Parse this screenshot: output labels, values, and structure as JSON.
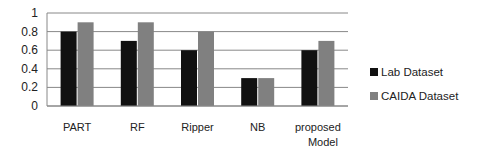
{
  "chart_data": {
    "type": "bar",
    "title": "",
    "xlabel": "",
    "ylabel": "",
    "ylim": [
      0,
      1
    ],
    "yticks": [
      "0",
      "0.2",
      "0.4",
      "0.6",
      "0.8",
      "1"
    ],
    "grid": true,
    "legend_position": "right",
    "categories": [
      "PART",
      "RF",
      "Ripper",
      "NB",
      "proposed Model"
    ],
    "series": [
      {
        "name": "Lab Dataset",
        "color": "#111111",
        "values": [
          0.8,
          0.7,
          0.6,
          0.3,
          0.6
        ]
      },
      {
        "name": "CAIDA Dataset",
        "color": "#808080",
        "values": [
          0.9,
          0.9,
          0.8,
          0.3,
          0.7
        ]
      }
    ]
  },
  "legend": {
    "items": [
      {
        "label": "Lab Dataset",
        "color": "#111111"
      },
      {
        "label": "CAIDA Dataset",
        "color": "#808080"
      }
    ]
  }
}
